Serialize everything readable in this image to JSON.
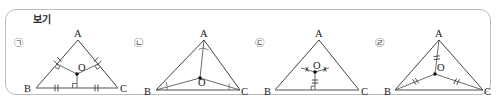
{
  "box": {
    "legend_label": "보기",
    "border_color": "#b9bcc0",
    "background": "#ffffff"
  },
  "figures": [
    {
      "tag": "㉠",
      "tag_name": "circled-giyeok",
      "vertices": {
        "A": "A",
        "B": "B",
        "C": "C"
      },
      "center_label": "O",
      "description": "circumcenter: perpendicular bisectors of the three sides meet at O",
      "marks": {
        "right_angle_squares": 3,
        "side_ticks": [
          "single",
          "single",
          "single"
        ]
      }
    },
    {
      "tag": "㉡",
      "tag_name": "circled-nieun",
      "vertices": {
        "A": "A",
        "B": "B",
        "C": "C"
      },
      "center_label": "O",
      "description": "incenter: angle bisectors from A, B and C meet at O",
      "marks": {
        "angle_arcs_at_vertices": 6,
        "side_ticks": []
      }
    },
    {
      "tag": "㉢",
      "tag_name": "circled-digeut",
      "vertices": {
        "A": "A",
        "B": "B",
        "C": "C"
      },
      "center_label": "O",
      "description": "point O with equal marked segments toward the sides and a marked perpendicular foot on BC",
      "marks": {
        "cross_ticks": 2,
        "single_tick_on_drop": 1
      }
    },
    {
      "tag": "㉣",
      "tag_name": "circled-rieul",
      "vertices": {
        "A": "A",
        "B": "B",
        "C": "C"
      },
      "center_label": "O",
      "description": "O joined to A, B and C with double tick marks showing OA = OB = OC",
      "marks": {
        "double_ticks": 3
      }
    }
  ],
  "colors": {
    "stroke": "#2f2f2f",
    "base_stroke": "#8a8a8a",
    "text": "#1a1a1a",
    "tag_text": "#3a3a3a"
  }
}
